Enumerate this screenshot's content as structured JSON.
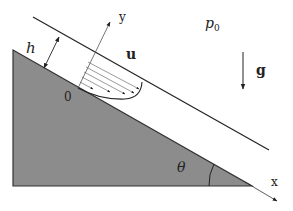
{
  "diagram": {
    "labels": {
      "film_thickness": "h",
      "y_axis": "y",
      "x_axis": "x",
      "velocity": "u",
      "pressure_base": "p",
      "pressure_sub": "0",
      "gravity": "g",
      "angle": "θ",
      "origin": "0"
    },
    "colors": {
      "incline_fill": "#8c8c8c",
      "line": "#222222",
      "background": "#ffffff"
    },
    "velocity_profile": {
      "arrow_count": 5,
      "shape": "semi-parabolic"
    }
  }
}
